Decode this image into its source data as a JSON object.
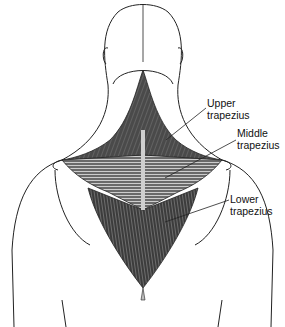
{
  "diagram": {
    "labels": [
      {
        "id": "upper",
        "line1": "Upper",
        "line2": "trapezius"
      },
      {
        "id": "middle",
        "line1": "Middle",
        "line2": "trapezius"
      },
      {
        "id": "lower",
        "line1": "Lower",
        "line2": "trapezius"
      }
    ]
  },
  "colors": {
    "outline": "#222222",
    "muscle_dark": "#3a3a3a",
    "muscle_mid": "#6a6a6a",
    "muscle_light": "#cfcfcf",
    "tendon": "#bdbdbd"
  }
}
